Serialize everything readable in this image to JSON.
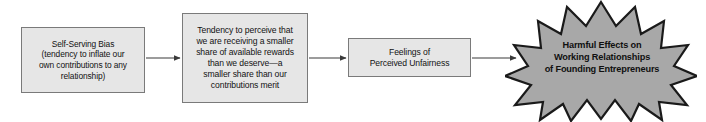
{
  "diagram": {
    "background_color": "#ffffff",
    "box_fill_color": "#e6e6e6",
    "box_border_color": "#7a7a7a",
    "burst_fill_color": "#a8a8a8",
    "burst_border_color": "#1a1a1a",
    "arrow_color": "#3a3a3a",
    "text_color": "#121212"
  },
  "nodes": {
    "bias": {
      "label": "Self-Serving Bias\n(tendency to inflate our\nown contributions to any\nrelationship)",
      "shape": "rectangle"
    },
    "tendency": {
      "label": "Tendency to perceive that\nwe are receiving a smaller\nshare of available rewards\nthan we deserve—a\nsmaller share than our\ncontributions merit",
      "shape": "rectangle"
    },
    "unfairness": {
      "label": "Feelings of\nPerceived Unfairness",
      "shape": "rectangle"
    },
    "harmful_effects": {
      "label": "Harmful Effects on\nWorking Relationships\nof Founding Entrepreneurs",
      "shape": "starburst-12-point"
    }
  },
  "connectors": [
    {
      "from": "bias",
      "to": "tendency",
      "style": "arrow-right"
    },
    {
      "from": "tendency",
      "to": "unfairness",
      "style": "arrow-right"
    },
    {
      "from": "unfairness",
      "to": "harmful_effects",
      "style": "arrow-right"
    }
  ]
}
